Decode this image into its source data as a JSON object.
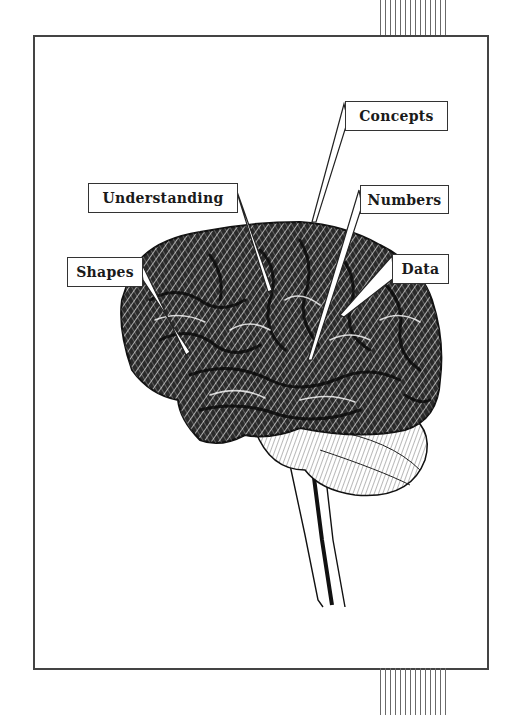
{
  "illustration": {
    "subject": "brain-side-view",
    "labels": [
      {
        "id": "concepts",
        "text": "Concepts"
      },
      {
        "id": "understanding",
        "text": "Understanding"
      },
      {
        "id": "numbers",
        "text": "Numbers"
      },
      {
        "id": "shapes",
        "text": "Shapes"
      },
      {
        "id": "data",
        "text": "Data"
      }
    ]
  },
  "colors": {
    "ink": "#1a1a1a",
    "frame": "#444444",
    "paper": "#ffffff"
  }
}
